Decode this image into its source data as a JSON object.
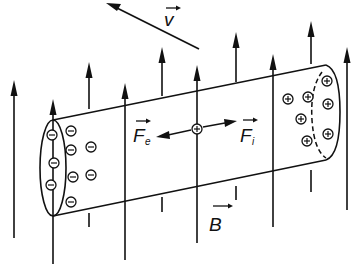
{
  "diagram": {
    "labels": {
      "velocity": "v",
      "magnetic_field": "B",
      "electric_force": "F",
      "electric_force_sub": "e",
      "lorentz_force": "F",
      "lorentz_force_sub": "i"
    },
    "charges": {
      "negative_symbol": "⊖",
      "positive_symbol": "⊕",
      "negative_count": 10,
      "positive_count": 8,
      "center_positive_count": 1
    },
    "field_line_count": 10,
    "colors": {
      "ink": "#111111",
      "background": "#ffffff"
    }
  }
}
